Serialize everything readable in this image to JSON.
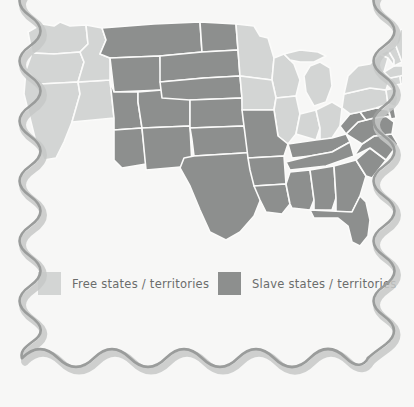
{
  "map": {
    "title": "Free and slave states and territories",
    "colors": {
      "free": "#d3d5d4",
      "slave": "#8d8f8e",
      "background": "#f7f7f6",
      "border_outline": "#fbfbfa",
      "frame": "#9a9c9b"
    },
    "regions": [
      {
        "name": "washington",
        "status": "free"
      },
      {
        "name": "oregon",
        "status": "free"
      },
      {
        "name": "california",
        "status": "free"
      },
      {
        "name": "nevada",
        "status": "free"
      },
      {
        "name": "idaho",
        "status": "free"
      },
      {
        "name": "montana",
        "status": "slave"
      },
      {
        "name": "wyoming",
        "status": "slave"
      },
      {
        "name": "utah",
        "status": "slave"
      },
      {
        "name": "arizona",
        "status": "slave"
      },
      {
        "name": "new-mexico",
        "status": "slave"
      },
      {
        "name": "colorado",
        "status": "slave"
      },
      {
        "name": "north-dakota",
        "status": "slave"
      },
      {
        "name": "south-dakota",
        "status": "slave"
      },
      {
        "name": "nebraska",
        "status": "slave"
      },
      {
        "name": "kansas",
        "status": "slave"
      },
      {
        "name": "oklahoma",
        "status": "slave"
      },
      {
        "name": "texas",
        "status": "slave"
      },
      {
        "name": "minnesota",
        "status": "free"
      },
      {
        "name": "iowa",
        "status": "free"
      },
      {
        "name": "missouri",
        "status": "slave"
      },
      {
        "name": "arkansas",
        "status": "slave"
      },
      {
        "name": "louisiana",
        "status": "slave"
      },
      {
        "name": "wisconsin",
        "status": "free"
      },
      {
        "name": "illinois",
        "status": "free"
      },
      {
        "name": "michigan",
        "status": "free"
      },
      {
        "name": "indiana",
        "status": "free"
      },
      {
        "name": "ohio",
        "status": "free"
      },
      {
        "name": "kentucky",
        "status": "slave"
      },
      {
        "name": "tennessee",
        "status": "slave"
      },
      {
        "name": "mississippi",
        "status": "slave"
      },
      {
        "name": "alabama",
        "status": "slave"
      },
      {
        "name": "georgia",
        "status": "slave"
      },
      {
        "name": "florida",
        "status": "slave"
      },
      {
        "name": "south-carolina",
        "status": "slave"
      },
      {
        "name": "north-carolina",
        "status": "slave"
      },
      {
        "name": "virginia",
        "status": "slave"
      },
      {
        "name": "west-virginia",
        "status": "slave"
      },
      {
        "name": "maryland",
        "status": "slave"
      },
      {
        "name": "delaware",
        "status": "slave"
      },
      {
        "name": "pennsylvania",
        "status": "free"
      },
      {
        "name": "new-york",
        "status": "free"
      },
      {
        "name": "new-jersey",
        "status": "free"
      },
      {
        "name": "connecticut",
        "status": "free"
      },
      {
        "name": "rhode-island",
        "status": "free"
      },
      {
        "name": "massachusetts",
        "status": "free"
      },
      {
        "name": "vermont",
        "status": "free"
      },
      {
        "name": "new-hampshire",
        "status": "free"
      },
      {
        "name": "maine",
        "status": "free"
      }
    ]
  },
  "legend": {
    "free": {
      "label": "Free states / territories",
      "swatch_color": "#d3d5d4"
    },
    "slave": {
      "label": "Slave states / territories",
      "swatch_color": "#8d8f8e"
    }
  }
}
